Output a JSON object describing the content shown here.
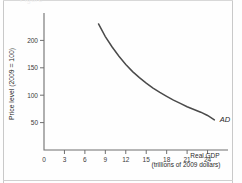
{
  "figure": {
    "top_faint_text": "Figure",
    "background_color": "#fefefe",
    "border_color": "#c9c9c9",
    "curve_color": "#4a4a4a",
    "axis_color": "#6f6f6f"
  },
  "chart_data": {
    "type": "line",
    "title": "",
    "subtitle": "",
    "xlabel": "Real GDP",
    "xlabel_sub": "(trillions of 2009 dollars)",
    "ylabel": "Price level (2009 = 100)",
    "xlim": [
      0,
      27
    ],
    "ylim": [
      0,
      250
    ],
    "xticks": [
      0,
      3,
      6,
      9,
      12,
      15,
      18,
      21,
      24
    ],
    "yticks": [
      50,
      100,
      150,
      200
    ],
    "grid": false,
    "legend": "none",
    "series": [
      {
        "name": "AD",
        "label": "AD",
        "label_style": "italic",
        "x": [
          8,
          9,
          10,
          11,
          12,
          13,
          14,
          15,
          16,
          17,
          18,
          19,
          20,
          21,
          22,
          23,
          24,
          25
        ],
        "y": [
          230,
          207,
          188,
          171,
          156,
          143,
          132,
          122,
          113,
          105,
          98,
          91,
          85,
          79,
          74,
          69,
          63,
          55
        ]
      }
    ],
    "annotations": [
      {
        "text": "AD",
        "x": 25.8,
        "y": 52,
        "style": "italic"
      }
    ]
  }
}
